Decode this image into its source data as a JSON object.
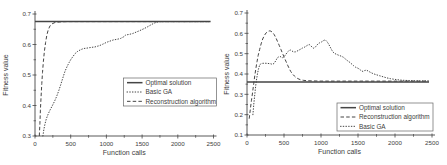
{
  "figure": {
    "background": "#ffffff",
    "line_color": "#454545",
    "text_color": "#3d3d3d",
    "legend_border_color": "#666666"
  },
  "chart_data": [
    {
      "type": "line",
      "title": "",
      "xlabel": "Function calls",
      "ylabel": "Fitness value",
      "xlim": [
        0,
        2500
      ],
      "ylim": [
        0.3,
        0.7
      ],
      "x_ticks": [
        0,
        500,
        1000,
        1500,
        2000,
        2500
      ],
      "y_ticks": [
        0.3,
        0.4,
        0.5,
        0.6,
        0.7
      ],
      "x_minor_step": 250,
      "y_minor_step": 0.05,
      "grid": false,
      "legend": {
        "position": "middle-right",
        "entries": [
          "Optimal solution",
          "Basic GA",
          "Reconstruction algorithm"
        ]
      },
      "series": [
        {
          "name": "Optimal solution",
          "style": "solid",
          "points": [
            [
              0,
              0.675
            ],
            [
              2460,
              0.675
            ]
          ]
        },
        {
          "name": "Basic GA",
          "style": "dotted",
          "points": [
            [
              110,
              0.3
            ],
            [
              125,
              0.322
            ],
            [
              140,
              0.34
            ],
            [
              160,
              0.357
            ],
            [
              185,
              0.372
            ],
            [
              210,
              0.385
            ],
            [
              240,
              0.398
            ],
            [
              270,
              0.412
            ],
            [
              300,
              0.428
            ],
            [
              330,
              0.447
            ],
            [
              360,
              0.468
            ],
            [
              390,
              0.49
            ],
            [
              420,
              0.512
            ],
            [
              450,
              0.528
            ],
            [
              480,
              0.542
            ],
            [
              500,
              0.55
            ],
            [
              530,
              0.56
            ],
            [
              560,
              0.57
            ],
            [
              600,
              0.578
            ],
            [
              640,
              0.583
            ],
            [
              680,
              0.587
            ],
            [
              720,
              0.588
            ],
            [
              780,
              0.59
            ],
            [
              840,
              0.592
            ],
            [
              900,
              0.596
            ],
            [
              950,
              0.601
            ],
            [
              1000,
              0.607
            ],
            [
              1050,
              0.611
            ],
            [
              1100,
              0.615
            ],
            [
              1150,
              0.617
            ],
            [
              1200,
              0.62
            ],
            [
              1240,
              0.625
            ],
            [
              1270,
              0.631
            ],
            [
              1320,
              0.633
            ],
            [
              1370,
              0.636
            ],
            [
              1420,
              0.641
            ],
            [
              1470,
              0.646
            ],
            [
              1520,
              0.651
            ],
            [
              1570,
              0.657
            ],
            [
              1620,
              0.664
            ],
            [
              1670,
              0.67
            ],
            [
              1720,
              0.674
            ],
            [
              1760,
              0.675
            ],
            [
              2450,
              0.675
            ]
          ]
        },
        {
          "name": "Reconstruction algorithm",
          "style": "dashed",
          "points": [
            [
              60,
              0.3
            ],
            [
              68,
              0.34
            ],
            [
              76,
              0.385
            ],
            [
              85,
              0.43
            ],
            [
              95,
              0.472
            ],
            [
              105,
              0.508
            ],
            [
              118,
              0.545
            ],
            [
              132,
              0.578
            ],
            [
              148,
              0.607
            ],
            [
              165,
              0.63
            ],
            [
              185,
              0.648
            ],
            [
              210,
              0.661
            ],
            [
              240,
              0.668
            ],
            [
              280,
              0.672
            ],
            [
              350,
              0.674
            ],
            [
              450,
              0.675
            ],
            [
              2450,
              0.675
            ]
          ]
        }
      ]
    },
    {
      "type": "line",
      "title": "",
      "xlabel": "Function calls",
      "ylabel": "Fitness value",
      "xlim": [
        0,
        2500
      ],
      "ylim": [
        0.1,
        0.7
      ],
      "x_ticks": [
        0,
        500,
        1000,
        1500,
        2000,
        2500
      ],
      "y_ticks": [
        0.1,
        0.2,
        0.3,
        0.4,
        0.5,
        0.6,
        0.7
      ],
      "x_minor_step": 250,
      "y_minor_step": 0.05,
      "grid": false,
      "legend": {
        "position": "bottom-right",
        "entries": [
          "Optimal solution",
          "Reconstruction algorithm",
          "Basic GA"
        ]
      },
      "series": [
        {
          "name": "Optimal solution",
          "style": "solid",
          "points": [
            [
              0,
              0.36
            ],
            [
              2460,
              0.36
            ]
          ]
        },
        {
          "name": "Reconstruction algorithm",
          "style": "dashed",
          "points": [
            [
              30,
              0.18
            ],
            [
              45,
              0.225
            ],
            [
              60,
              0.268
            ],
            [
              75,
              0.31
            ],
            [
              90,
              0.352
            ],
            [
              105,
              0.392
            ],
            [
              120,
              0.428
            ],
            [
              135,
              0.46
            ],
            [
              152,
              0.492
            ],
            [
              170,
              0.52
            ],
            [
              190,
              0.548
            ],
            [
              212,
              0.572
            ],
            [
              235,
              0.59
            ],
            [
              258,
              0.602
            ],
            [
              280,
              0.609
            ],
            [
              300,
              0.612
            ],
            [
              322,
              0.611
            ],
            [
              345,
              0.605
            ],
            [
              368,
              0.594
            ],
            [
              390,
              0.578
            ],
            [
              412,
              0.56
            ],
            [
              435,
              0.541
            ],
            [
              458,
              0.521
            ],
            [
              480,
              0.502
            ],
            [
              502,
              0.483
            ],
            [
              525,
              0.463
            ],
            [
              548,
              0.444
            ],
            [
              570,
              0.427
            ],
            [
              592,
              0.412
            ],
            [
              615,
              0.4
            ],
            [
              640,
              0.39
            ],
            [
              665,
              0.382
            ],
            [
              690,
              0.377
            ],
            [
              720,
              0.372
            ],
            [
              760,
              0.369
            ],
            [
              810,
              0.367
            ],
            [
              880,
              0.366
            ],
            [
              1000,
              0.365
            ],
            [
              2450,
              0.365
            ]
          ]
        },
        {
          "name": "Basic GA",
          "style": "dotted",
          "points": [
            [
              80,
              0.2
            ],
            [
              92,
              0.252
            ],
            [
              105,
              0.3
            ],
            [
              118,
              0.342
            ],
            [
              130,
              0.375
            ],
            [
              142,
              0.402
            ],
            [
              155,
              0.425
            ],
            [
              168,
              0.44
            ],
            [
              182,
              0.449
            ],
            [
              200,
              0.452
            ],
            [
              240,
              0.453
            ],
            [
              280,
              0.452
            ],
            [
              320,
              0.45
            ],
            [
              345,
              0.447
            ],
            [
              365,
              0.452
            ],
            [
              385,
              0.463
            ],
            [
              405,
              0.476
            ],
            [
              425,
              0.484
            ],
            [
              445,
              0.487
            ],
            [
              465,
              0.482
            ],
            [
              485,
              0.479
            ],
            [
              505,
              0.487
            ],
            [
              525,
              0.497
            ],
            [
              545,
              0.507
            ],
            [
              565,
              0.514
            ],
            [
              585,
              0.518
            ],
            [
              605,
              0.514
            ],
            [
              625,
              0.509
            ],
            [
              650,
              0.508
            ],
            [
              675,
              0.512
            ],
            [
              700,
              0.517
            ],
            [
              725,
              0.522
            ],
            [
              750,
              0.528
            ],
            [
              775,
              0.532
            ],
            [
              800,
              0.537
            ],
            [
              820,
              0.542
            ],
            [
              840,
              0.545
            ],
            [
              860,
              0.54
            ],
            [
              880,
              0.532
            ],
            [
              900,
              0.527
            ],
            [
              920,
              0.531
            ],
            [
              940,
              0.54
            ],
            [
              960,
              0.548
            ],
            [
              980,
              0.553
            ],
            [
              1000,
              0.556
            ],
            [
              1020,
              0.561
            ],
            [
              1040,
              0.566
            ],
            [
              1060,
              0.567
            ],
            [
              1080,
              0.56
            ],
            [
              1100,
              0.549
            ],
            [
              1120,
              0.535
            ],
            [
              1140,
              0.521
            ],
            [
              1160,
              0.509
            ],
            [
              1185,
              0.501
            ],
            [
              1210,
              0.497
            ],
            [
              1240,
              0.492
            ],
            [
              1270,
              0.488
            ],
            [
              1300,
              0.483
            ],
            [
              1330,
              0.474
            ],
            [
              1360,
              0.465
            ],
            [
              1390,
              0.457
            ],
            [
              1415,
              0.449
            ],
            [
              1440,
              0.441
            ],
            [
              1465,
              0.434
            ],
            [
              1490,
              0.43
            ],
            [
              1515,
              0.425
            ],
            [
              1540,
              0.417
            ],
            [
              1565,
              0.413
            ],
            [
              1590,
              0.417
            ],
            [
              1615,
              0.419
            ],
            [
              1645,
              0.413
            ],
            [
              1675,
              0.407
            ],
            [
              1710,
              0.401
            ],
            [
              1750,
              0.396
            ],
            [
              1795,
              0.391
            ],
            [
              1840,
              0.386
            ],
            [
              1890,
              0.381
            ],
            [
              1940,
              0.377
            ],
            [
              1990,
              0.374
            ],
            [
              2050,
              0.371
            ],
            [
              2110,
              0.369
            ],
            [
              2170,
              0.368
            ],
            [
              2250,
              0.367
            ],
            [
              2350,
              0.366
            ],
            [
              2450,
              0.366
            ]
          ]
        }
      ]
    }
  ]
}
